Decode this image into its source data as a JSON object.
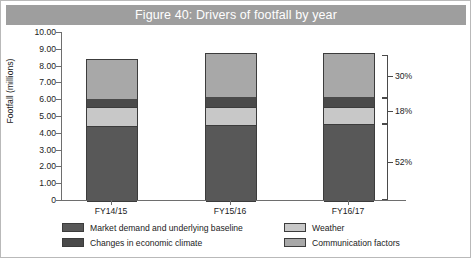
{
  "figure": {
    "title": "Figure 40: Drivers of footfall by year",
    "title_band_color": "#9e9e9e",
    "title_text_color": "#ffffff"
  },
  "chart_data": {
    "type": "bar",
    "subtype": "stacked-bar-vertical",
    "title": "Figure 40: Drivers of footfall by year",
    "xlabel": "",
    "ylabel": "Footfall (millions)",
    "ylim": [
      0,
      10
    ],
    "ytick_step": 1,
    "ytick_labels": [
      "10.00",
      "9.00",
      "8.00",
      "7.00",
      "6.00",
      "5.00",
      "4.00",
      "3.00",
      "2.00",
      "1.00",
      "0"
    ],
    "ytick_values": [
      10,
      9,
      8,
      7,
      6,
      5,
      4,
      3,
      2,
      1,
      0
    ],
    "grid": false,
    "legend_position": "bottom",
    "categories": [
      "FY14/15",
      "FY15/16",
      "FY16/17"
    ],
    "stack_order_bottom_to_top": [
      "Market demand and underlying baseline",
      "Weather",
      "Changes in economic climate",
      "Communication factors"
    ],
    "series": [
      {
        "name": "Market demand and underlying baseline",
        "color": "#585858",
        "values": [
          4.4,
          4.48,
          4.5
        ]
      },
      {
        "name": "Weather",
        "color": "#c8c8c8",
        "values": [
          1.05,
          1.02,
          1.0
        ]
      },
      {
        "name": "Changes in economic climate",
        "color": "#4a4a4a",
        "values": [
          0.5,
          0.6,
          0.6
        ]
      },
      {
        "name": "Communication factors",
        "color": "#a8a8a8",
        "values": [
          2.35,
          2.55,
          2.55
        ]
      }
    ],
    "totals": [
      8.3,
      8.65,
      8.65
    ],
    "annotations": [
      {
        "label": "30%",
        "bracket_from": 6.1,
        "bracket_to": 8.65,
        "describes": "Communication factors"
      },
      {
        "label": "18%",
        "bracket_from": 4.5,
        "bracket_to": 6.1,
        "describes": "Weather and changes in economic climate"
      },
      {
        "label": "52%",
        "bracket_from": 0.0,
        "bracket_to": 4.5,
        "describes": "Market demand and underlying baseline"
      }
    ]
  },
  "legend": {
    "items": [
      {
        "label": "Market demand and underlying baseline",
        "color": "#585858"
      },
      {
        "label": "Weather",
        "color": "#c8c8c8"
      },
      {
        "label": "Changes in economic climate",
        "color": "#4a4a4a"
      },
      {
        "label": "Communication factors",
        "color": "#a8a8a8"
      }
    ]
  }
}
